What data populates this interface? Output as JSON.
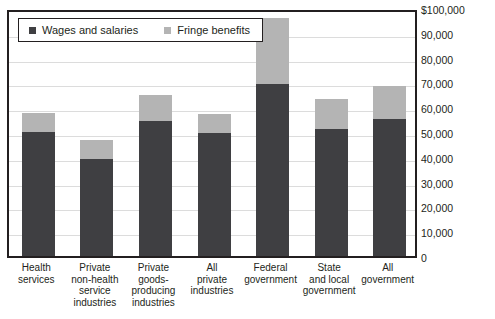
{
  "chart_data": {
    "type": "bar",
    "subtype": "stacked-vertical",
    "title": "",
    "xlabel": "",
    "ylabel": "",
    "ylim": [
      0,
      100000
    ],
    "grid": true,
    "legend_position": "top-left",
    "categories": [
      "Health\nservices",
      "Private\nnon-health\nservice\nindustries",
      "Private\ngoods-\nproducing\nindustries",
      "All\nprivate\nindustries",
      "Federal\ngovernment",
      "State\nand local\ngovernment",
      "All\ngovernment"
    ],
    "series": [
      {
        "name": "Wages and salaries",
        "color": "#3f3f42",
        "values": [
          50000,
          39100,
          54400,
          49600,
          69500,
          51200,
          55200
        ]
      },
      {
        "name": "Fringe benefits",
        "color": "#b4b4b4",
        "values": [
          7700,
          7700,
          10600,
          7700,
          26500,
          12100,
          13300
        ]
      }
    ],
    "totals": [
      57700,
      46800,
      65000,
      57300,
      96000,
      63300,
      68500
    ],
    "y_ticks": [
      {
        "value": 100000,
        "label": "$100,000"
      },
      {
        "value": 90000,
        "label": "90,000"
      },
      {
        "value": 80000,
        "label": "80,000"
      },
      {
        "value": 70000,
        "label": "70,000"
      },
      {
        "value": 60000,
        "label": "60,000"
      },
      {
        "value": 50000,
        "label": "50,000"
      },
      {
        "value": 40000,
        "label": "40,000"
      },
      {
        "value": 30000,
        "label": "30,000"
      },
      {
        "value": 20000,
        "label": "20,000"
      },
      {
        "value": 10000,
        "label": "10,000"
      },
      {
        "value": 0,
        "label": "0"
      }
    ],
    "legend": [
      {
        "label": "Wages and salaries",
        "color": "#3f3f42",
        "swatch": "square-dark"
      },
      {
        "label": "Fringe benefits",
        "color": "#b4b4b4",
        "swatch": "square-light"
      }
    ]
  },
  "colors": {
    "wages": "#3f3f42",
    "fringe": "#b4b4b4",
    "frame": "#231f20",
    "gridline": "#dcdcdc",
    "background": "#ffffff",
    "text": "#231f20"
  }
}
